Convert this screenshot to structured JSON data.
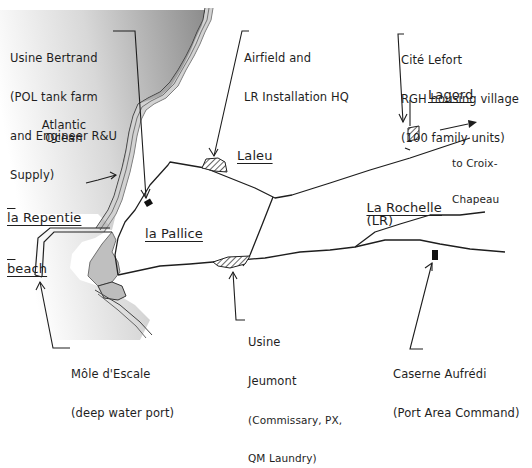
{
  "map": {
    "water_label": "Atlantic Ocean",
    "places": {
      "laleu": "Laleu",
      "la_pallice": "la Pallice",
      "la_rochelle": "La Rochelle",
      "la_rochelle_abbr": "(LR)",
      "lagord": "Lagord",
      "la_repentie_line1": "la Repentie",
      "la_repentie_line2": "beach"
    },
    "direction": {
      "line1": "to Croix-",
      "line2": "Chapeau"
    },
    "callouts": {
      "usine_bertrand": {
        "line1": "Usine Bertrand",
        "line2": "(POL tank farm",
        "line3": "and Engineer R&U",
        "line4": "Supply)"
      },
      "airfield": {
        "line1": "Airfield and",
        "line2": "LR Installation HQ"
      },
      "cite_lefort": {
        "line1": "Cité Lefort",
        "line2": "RGH housing village",
        "line3": "(100 family units)"
      },
      "usine_jeumont": {
        "line1": "Usine",
        "line2": "Jeumont",
        "line3": "(Commissary, PX,",
        "line4": "QM Laundry)"
      },
      "mole_escale": {
        "line1": "Môle d'Escale",
        "line2": "(deep water port)"
      },
      "caserne_aufredi": {
        "line1": "Caserne Aufrédi",
        "line2": "(Port Area Command)"
      }
    },
    "colors": {
      "ink": "#1e1e1e",
      "water_dark": "#8a8a8a",
      "water_light": "#ffffff",
      "coast_band": "#b0b0b0"
    }
  }
}
